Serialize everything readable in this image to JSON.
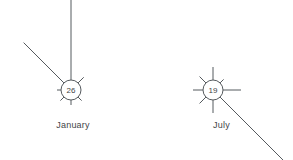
{
  "figure": {
    "type": "wind-rose-pair",
    "background_color": "#ffffff",
    "line_color": "#555a5e",
    "text_color": "#3f4447",
    "width": 293,
    "height": 160
  },
  "roses": [
    {
      "key": "january",
      "label": "January",
      "calm_value": "26",
      "center": {
        "x": 71,
        "y": 90
      },
      "radius": 10,
      "label_position": {
        "x": 0,
        "y": 120,
        "width": 146
      },
      "spokes": [
        {
          "direction": "N",
          "angle_deg": 0,
          "length": 85,
          "kind": "long"
        },
        {
          "direction": "NE",
          "angle_deg": 45,
          "length": 8,
          "kind": "short"
        },
        {
          "direction": "E",
          "angle_deg": 90,
          "length": 0,
          "kind": "none"
        },
        {
          "direction": "SE",
          "angle_deg": 135,
          "length": 5,
          "kind": "short"
        },
        {
          "direction": "S",
          "angle_deg": 180,
          "length": 5,
          "kind": "short"
        },
        {
          "direction": "SW",
          "angle_deg": 225,
          "length": 5,
          "kind": "short"
        },
        {
          "direction": "W",
          "angle_deg": 270,
          "length": 4,
          "kind": "short"
        },
        {
          "direction": "NW",
          "angle_deg": 315,
          "length": 57,
          "kind": "long"
        }
      ]
    },
    {
      "key": "july",
      "label": "July",
      "calm_value": "19",
      "center": {
        "x": 213,
        "y": 90
      },
      "radius": 10,
      "label_position": {
        "x": 150,
        "y": 120,
        "width": 143
      },
      "spokes": [
        {
          "direction": "N",
          "angle_deg": 0,
          "length": 13,
          "kind": "medium"
        },
        {
          "direction": "NE",
          "angle_deg": 45,
          "length": 5,
          "kind": "short"
        },
        {
          "direction": "E",
          "angle_deg": 90,
          "length": 18,
          "kind": "medium"
        },
        {
          "direction": "SE",
          "angle_deg": 135,
          "length": 96,
          "kind": "long"
        },
        {
          "direction": "S",
          "angle_deg": 180,
          "length": 13,
          "kind": "medium"
        },
        {
          "direction": "SW",
          "angle_deg": 225,
          "length": 9,
          "kind": "short"
        },
        {
          "direction": "W",
          "angle_deg": 270,
          "length": 10,
          "kind": "medium"
        },
        {
          "direction": "NW",
          "angle_deg": 315,
          "length": 9,
          "kind": "short"
        }
      ]
    }
  ],
  "chart_data": {
    "type": "wind-rose",
    "title": "",
    "xlabel": "",
    "ylabel": "",
    "legend": [],
    "grid": false,
    "panels": [
      {
        "name": "January",
        "calm_percent": 26,
        "directions": [
          "N",
          "NE",
          "E",
          "SE",
          "S",
          "SW",
          "W",
          "NW"
        ],
        "frequencies": [
          85,
          8,
          0,
          5,
          5,
          5,
          4,
          57
        ]
      },
      {
        "name": "July",
        "calm_percent": 19,
        "directions": [
          "N",
          "NE",
          "E",
          "SE",
          "S",
          "SW",
          "W",
          "NW"
        ],
        "frequencies": [
          13,
          5,
          18,
          96,
          13,
          9,
          10,
          9
        ]
      }
    ]
  }
}
